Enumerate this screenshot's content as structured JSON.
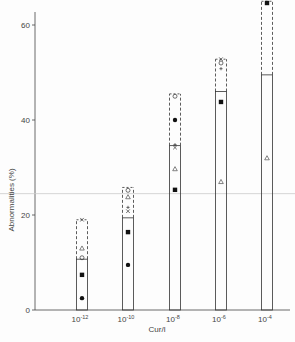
{
  "chart_data": {
    "type": "bar",
    "title": "",
    "xlabel": "Cur/l",
    "ylabel": "Abnormalities (%)",
    "ylim": [
      0,
      65
    ],
    "yticks": [
      0,
      20,
      40,
      60
    ],
    "grid": false,
    "categories": [
      "10^-12",
      "10^-10",
      "10^-8",
      "10^-6",
      "10^-4"
    ],
    "category_labels": [
      {
        "base": "10",
        "exp": "-12"
      },
      {
        "base": "10",
        "exp": "-10"
      },
      {
        "base": "10",
        "exp": "-8"
      },
      {
        "base": "10",
        "exp": "-6"
      },
      {
        "base": "10",
        "exp": "-4"
      }
    ],
    "bar_values": [
      10.7,
      19.4,
      34.6,
      46.0,
      49.5
    ],
    "dashed_upper": [
      19.0,
      25.8,
      45.5,
      52.8,
      65.0
    ],
    "reference_line": 24.5,
    "series": [
      {
        "name": "filled-circle",
        "marker": "●",
        "values": [
          2.5,
          9.5,
          40.0,
          null,
          null
        ]
      },
      {
        "name": "filled-square",
        "marker": "■",
        "values": [
          7.4,
          16.4,
          25.3,
          43.8,
          65.0
        ]
      },
      {
        "name": "open-circle",
        "marker": "○",
        "values": [
          11.0,
          25.2,
          45.0,
          52.0,
          null
        ]
      },
      {
        "name": "open-triangle",
        "marker": "△",
        "values": [
          13.0,
          23.8,
          29.7,
          27.0,
          32.0
        ]
      },
      {
        "name": "cross-x",
        "marker": "x",
        "values": [
          19.0,
          20.8,
          34.2,
          52.8,
          null
        ]
      },
      {
        "name": "plus",
        "marker": "+",
        "values": [
          null,
          21.6,
          34.8,
          50.8,
          null
        ]
      }
    ]
  }
}
